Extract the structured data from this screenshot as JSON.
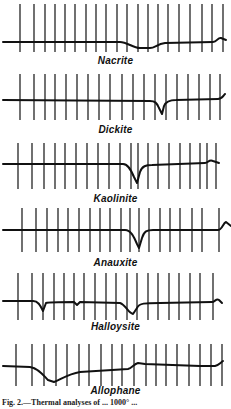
{
  "figure": {
    "caption": "Fig. 2.—Thermal analyses of ... 1000° ...",
    "ink_color": "#111111",
    "background": "#ffffff"
  },
  "chart_data": {
    "type": "line",
    "xlabel": "",
    "ylabel": "",
    "grid": "vertical time/temperature ticks",
    "series": [
      {
        "name": "Nacrite",
        "label_y": 61,
        "top": 0,
        "ticks": [
          20,
          34,
          45,
          55,
          65,
          75,
          86,
          96,
          106,
          117,
          127,
          138,
          148,
          158,
          168,
          179,
          190,
          202,
          212,
          223
        ],
        "tick_top": 4,
        "tick_bottom": 52,
        "path": "M3,42 L120,42 C127,42 133,48 140,48 L150,48 C155,48 157,44 165,43 L213,42 C217,42 218,37 221,38 L226,40"
      },
      {
        "name": "Dickite",
        "label_y": 131,
        "top": 70,
        "ticks": [
          20,
          34,
          45,
          55,
          66,
          77,
          88,
          99,
          110,
          122,
          133,
          144,
          155,
          166,
          177,
          188,
          199,
          210,
          220
        ],
        "tick_top": 74,
        "tick_bottom": 120,
        "path": "M3,100 L150,101 C155,101 157,103 159,108 L162,114 L164,106 C166,101 170,100 176,100 L218,99 C222,99 223,96 225,94"
      },
      {
        "name": "Kaolinite",
        "label_y": 199,
        "top": 140,
        "ticks": [
          18,
          32,
          44,
          55,
          65,
          76,
          87,
          98,
          109,
          120,
          131,
          138,
          148,
          158,
          169,
          180,
          190,
          200,
          207,
          216
        ],
        "tick_top": 143,
        "tick_bottom": 189,
        "path": "M3,164 L123,164 C128,164 131,170 134,177 L137,183 L140,172 C142,166 146,165 152,165 L205,163 C208,163 209,159 213,161 L219,163"
      },
      {
        "name": "Anauxite",
        "label_y": 263,
        "top": 205,
        "ticks": [
          22,
          36,
          47,
          58,
          68,
          79,
          90,
          100,
          110,
          121,
          130,
          139,
          149,
          160,
          170,
          180,
          192,
          202,
          219
        ],
        "tick_top": 208,
        "tick_bottom": 252,
        "path": "M3,230 L125,230 C131,230 134,237 137,244 L139,248 L142,238 C144,231 147,230 153,230 L218,230 C222,230 223,223 226,222 L231,226"
      },
      {
        "name": "Halloysite",
        "label_y": 327,
        "top": 270,
        "ticks": [
          18,
          32,
          43,
          54,
          64,
          74,
          84,
          95,
          106,
          116,
          127,
          137,
          148,
          158,
          169,
          179,
          190,
          200,
          213
        ],
        "tick_top": 273,
        "tick_bottom": 320,
        "path": "M3,301 L33,301 C38,301 40,305 43,311 L46,303 C49,302 60,302 74,302 L77,305 L80,302 L120,303 C126,305 128,313 133,314 L137,308 C139,303 145,303 160,303 L212,302 C215,302 216,298 219,300 L222,303"
      },
      {
        "name": "Allophane",
        "label_y": 392,
        "top": 340,
        "ticks": [
          16,
          32,
          44,
          56,
          67,
          79,
          89,
          101,
          112,
          122,
          134,
          146,
          156,
          166,
          177,
          189,
          200,
          211,
          222
        ],
        "tick_top": 344,
        "tick_bottom": 386,
        "path": "M3,366 L30,367 C38,368 43,375 48,380 L54,382 C60,380 68,374 80,372 L128,369 C132,368 134,364 138,363 L145,364 L200,366 L215,366 C219,365 220,363 223,361"
      }
    ]
  },
  "panels": [
    {
      "label": "Nacrite"
    },
    {
      "label": "Dickite"
    },
    {
      "label": "Kaolinite"
    },
    {
      "label": "Anauxite"
    },
    {
      "label": "Halloysite"
    },
    {
      "label": "Allophane"
    }
  ]
}
